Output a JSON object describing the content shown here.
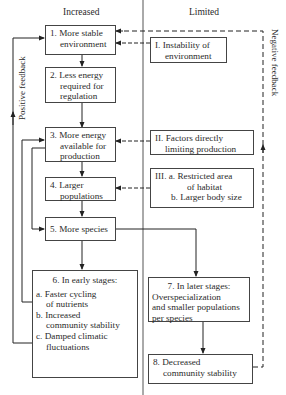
{
  "headers": {
    "left": "Increased",
    "right": "Limited"
  },
  "side_labels": {
    "left": "Positive feedback",
    "right": "Negative feedback"
  },
  "left_column": {
    "box1": {
      "num": "1.",
      "lines": [
        "More stable",
        "environment"
      ]
    },
    "box2": {
      "num": "2.",
      "lines": [
        "Less energy",
        "required for",
        "regulation"
      ]
    },
    "box3": {
      "num": "3.",
      "lines": [
        "More energy",
        "available for",
        "production"
      ]
    },
    "box4": {
      "num": "4.",
      "lines": [
        "Larger",
        "populations"
      ]
    },
    "box5": {
      "num": "5.",
      "lines": [
        "More species"
      ]
    },
    "box6": {
      "title": "6.  In early stages:",
      "items": [
        {
          "letter": "a.",
          "lines": [
            "Faster cycling",
            "of nutrients"
          ]
        },
        {
          "letter": "b.",
          "lines": [
            "Increased",
            "community stability"
          ]
        },
        {
          "letter": "c.",
          "lines": [
            "Damped climatic",
            "fluctuations"
          ]
        }
      ]
    }
  },
  "right_column": {
    "boxI": {
      "num": "I.",
      "lines": [
        "Instability of",
        "environment"
      ]
    },
    "boxII": {
      "num": "II.",
      "lines": [
        "Factors directly",
        "limiting production"
      ]
    },
    "boxIII": {
      "num": "III.",
      "items": [
        {
          "letter": "a.",
          "lines": [
            "Restricted area",
            "of habitat"
          ]
        },
        {
          "letter": "b.",
          "lines": [
            "Larger body size"
          ]
        }
      ]
    },
    "box7": {
      "title": "7.  In later stages:",
      "lines": [
        "Overspecialization",
        "and smaller populations",
        "per species"
      ]
    },
    "box8": {
      "num": "8.",
      "lines": [
        "Decreased",
        "community stability"
      ]
    }
  },
  "colors": {
    "line": "#333333",
    "background": "#ffffff"
  }
}
